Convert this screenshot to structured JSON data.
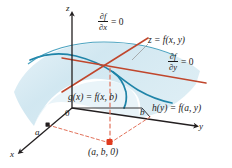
{
  "figure": {
    "kind": "3d-surface-critical-point-diagram",
    "background": "#ffffff"
  },
  "axes": {
    "z_label": "z",
    "x_label": "x",
    "y_label": "y",
    "origin_label": "0",
    "tick_a_label": "a",
    "tick_b_label": "b",
    "axis_color": "#231f20"
  },
  "annotations": {
    "partial_x": {
      "numerator": "∂f",
      "denominator": "∂x",
      "rhs": "= 0"
    },
    "partial_y": {
      "numerator": "∂f",
      "denominator": "∂y",
      "rhs": "= 0"
    },
    "surface_label": "z = f(x, y)",
    "trace_g_label": "g(x) = f(x, b)",
    "trace_h_label": "h(y) = f(a, y)",
    "point_label": "(a, b, 0)"
  },
  "colors": {
    "surface_fill": "#cfe4ef",
    "surface_edge": "#2d93b5",
    "trace_curve": "#1f84a8",
    "tangent_line": "#c0462c",
    "dashed_projection": "#e2725b",
    "point_marker": "#e03a1e",
    "leader_line": "#9a9a9a",
    "text": "#1a1a1a"
  }
}
